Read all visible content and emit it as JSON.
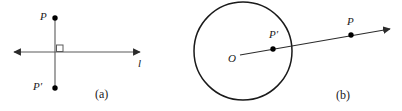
{
  "figure": {
    "width": 402,
    "height": 111,
    "background": "#ffffff",
    "stroke_color": "#3a3a3a",
    "circle_stroke_color": "#1a1a1a",
    "point_color": "#000000",
    "text_color": "#1a1a1a"
  },
  "panel_a": {
    "caption": "(a)",
    "line_label": "l",
    "point_p_label": "P",
    "point_p_prime_label": "P′",
    "right_angle_marker": "right-angle-square",
    "geometry": {
      "line_l": {
        "x1": 8,
        "y1": 52,
        "x2": 146,
        "y2": 52,
        "arrows": "both"
      },
      "segment_pp": {
        "x1": 55,
        "y1": 18,
        "x2": 55,
        "y2": 88
      },
      "point_p": {
        "cx": 55,
        "cy": 18,
        "r": 2.6
      },
      "point_p_prime": {
        "cx": 55,
        "cy": 88,
        "r": 2.6
      },
      "right_angle": {
        "x": 56,
        "y": 45,
        "size": 7
      }
    },
    "label_positions": {
      "p": {
        "left": 40,
        "top": 11
      },
      "p_prime": {
        "left": 33,
        "top": 81
      },
      "l": {
        "left": 138,
        "top": 58
      },
      "caption": {
        "left": 95,
        "top": 88
      }
    }
  },
  "panel_b": {
    "caption": "(b)",
    "center_label": "O",
    "point_p_label": "P",
    "point_p_prime_label": "P′",
    "geometry": {
      "circle": {
        "cx": 243,
        "cy": 51,
        "r": 49
      },
      "ray": {
        "x1": 240,
        "y1": 55,
        "x2": 396,
        "y2": 28,
        "arrows": "end"
      },
      "point_p_prime": {
        "cx": 273,
        "cy": 49,
        "r": 2.6
      },
      "point_p": {
        "cx": 351,
        "cy": 35,
        "r": 2.6
      }
    },
    "label_positions": {
      "o": {
        "left": 228,
        "top": 53
      },
      "p_prime": {
        "left": 269,
        "top": 29
      },
      "p": {
        "left": 347,
        "top": 16
      },
      "caption": {
        "left": 336,
        "top": 89
      }
    }
  }
}
